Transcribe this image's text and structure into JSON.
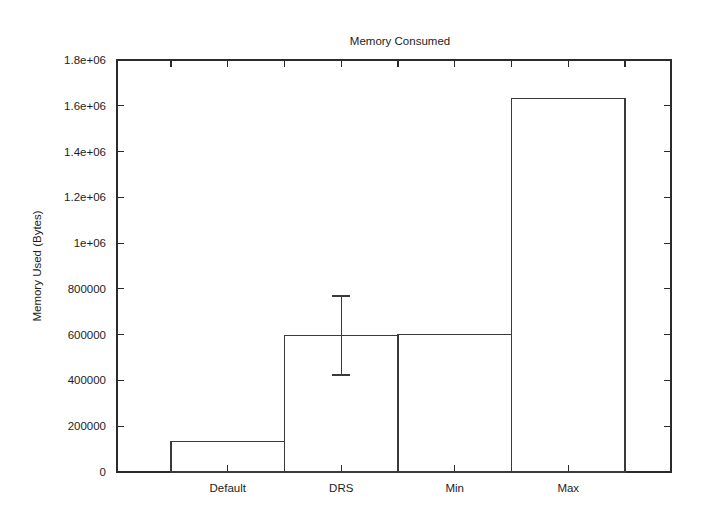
{
  "chart_data": {
    "type": "bar",
    "title": "Memory Consumed",
    "xlabel": "",
    "ylabel": "Memory Used (Bytes)",
    "categories": [
      "Default",
      "DRS",
      "Min",
      "Max"
    ],
    "values": [
      135000,
      598000,
      600000,
      1630000
    ],
    "errors": [
      null,
      {
        "low": 424000,
        "high": 769000
      },
      null,
      null
    ],
    "ylim": [
      0,
      1800000
    ],
    "yticks": [
      0,
      200000,
      400000,
      600000,
      800000,
      1000000,
      1200000,
      1400000,
      1600000,
      1800000
    ],
    "ytick_labels": [
      "0",
      "200000",
      "400000",
      "600000",
      "800000",
      "1e+06",
      "1.2e+06",
      "1.4e+06",
      "1.6e+06",
      "1.8e+06"
    ],
    "grid": false,
    "legend": null,
    "bar_style": "outline",
    "colors": {
      "background": "#ffffff",
      "axis": "#2b2b2b",
      "bar_outline": "#3a3a3a",
      "text": "#1d1d1d"
    }
  }
}
